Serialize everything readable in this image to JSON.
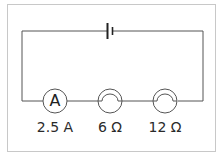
{
  "diagram": {
    "type": "series circuit",
    "components": [
      {
        "kind": "cell",
        "symbol": "battery"
      },
      {
        "kind": "ammeter",
        "symbol_text": "A",
        "label": "2.5 A"
      },
      {
        "kind": "lamp",
        "label": "6 Ω"
      },
      {
        "kind": "lamp",
        "label": "12 Ω"
      }
    ],
    "colors": {
      "wire": "#555555",
      "frame": "#c8c8c8",
      "text": "#2a2a2a"
    }
  }
}
